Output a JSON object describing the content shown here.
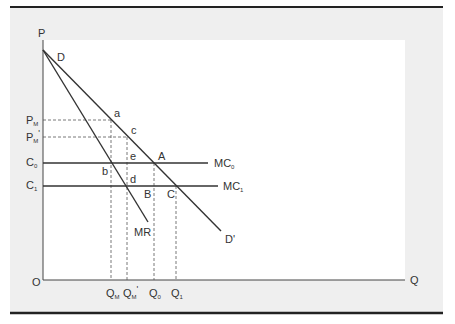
{
  "diagram": {
    "type": "economics-monopoly-cost-reduction",
    "axes": {
      "y_label": "P",
      "x_label": "Q",
      "origin_label": "O"
    },
    "curves": {
      "demand_start_label": "D",
      "demand_end_label": "D'",
      "marginal_revenue_label": "MR",
      "mc0_label": "MC",
      "mc0_sub": "0",
      "mc1_label": "MC",
      "mc1_sub": "1"
    },
    "y_ticks": [
      {
        "label": "P",
        "sub": "M",
        "prime": ""
      },
      {
        "label": "P",
        "sub": "M",
        "prime": "'"
      },
      {
        "label": "C",
        "sub": "0",
        "prime": ""
      },
      {
        "label": "C",
        "sub": "1",
        "prime": ""
      }
    ],
    "x_ticks": [
      {
        "label": "Q",
        "sub": "M",
        "prime": ""
      },
      {
        "label": "Q",
        "sub": "M",
        "prime": "'"
      },
      {
        "label": "Q",
        "sub": "0",
        "prime": ""
      },
      {
        "label": "Q",
        "sub": "1",
        "prime": ""
      }
    ],
    "points": {
      "a": "a",
      "b": "b",
      "c": "c",
      "d": "d",
      "e": "e",
      "A": "A",
      "B": "B",
      "C": "C"
    },
    "colors": {
      "panel": "#efefef",
      "plot": "#ffffff",
      "ink": "#333333",
      "rule": "#222222"
    }
  }
}
